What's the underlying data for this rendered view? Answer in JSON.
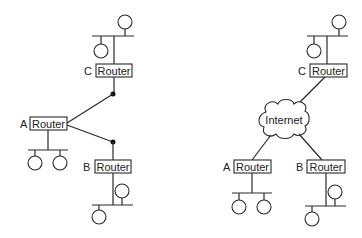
{
  "diagrams": [
    {
      "name": "point-to-point",
      "routers": [
        {
          "id": "C",
          "label": "Router"
        },
        {
          "id": "A",
          "label": "Router"
        },
        {
          "id": "B",
          "label": "Router"
        }
      ]
    },
    {
      "name": "via-internet",
      "cloud_label": "Internet",
      "routers": [
        {
          "id": "C",
          "label": "Router"
        },
        {
          "id": "A",
          "label": "Router"
        },
        {
          "id": "B",
          "label": "Router"
        }
      ]
    }
  ]
}
